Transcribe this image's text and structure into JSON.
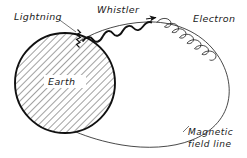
{
  "figure": {
    "width": 247,
    "height": 158,
    "background_color": "#ffffff",
    "ink_color": "#111111",
    "leader_color": "#555555"
  },
  "labels": {
    "lightning": "Lightning",
    "whistler": "Whistler",
    "electron": "Electron",
    "earth": "Earth",
    "magnetic_line_1": "Magnetic",
    "magnetic_line_2": "field  line"
  },
  "elements": {
    "earth": {
      "name": "earth-disk",
      "center_x": 65,
      "center_y": 83,
      "radius": 50,
      "fill_pattern": "diagonal-hatch",
      "hatch_angle_deg": 45
    },
    "lightning_bolt": {
      "name": "lightning-zigzag",
      "x": 78,
      "y_top": 29,
      "y_bottom": 47
    },
    "whistler_wave": {
      "name": "whistler-wave",
      "start_x": 82,
      "start_y": 41,
      "end_x": 152,
      "end_y": 22,
      "humps": 4
    },
    "electron_helix": {
      "name": "electron-helix",
      "start_x": 158,
      "start_y": 21,
      "end_x": 218,
      "end_y": 62,
      "loops": 7
    },
    "direction_arrow": {
      "name": "propagation-arrow",
      "x": 152,
      "y": 17,
      "points": "right"
    },
    "field_line": {
      "name": "magnetic-field-line",
      "description": "large loop from north of Earth out to the right and back under Earth"
    }
  }
}
